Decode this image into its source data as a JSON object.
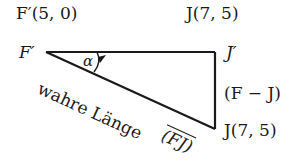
{
  "labels": {
    "f_prime_coord": "F′(5, 0)",
    "j_coord_top": "J(7, 5)",
    "f_prime": "F′",
    "j_prime": "J′",
    "alpha": "α",
    "f_minus_j": "(F − J)",
    "wahre_laenge": "wahre Länge",
    "fj": "(FJ)",
    "j_coord_bottom": "J(7, 5)"
  },
  "geometry": {
    "f_prime_point": [
      46,
      52
    ],
    "j_prime_point": [
      215,
      52
    ],
    "j_point": [
      215,
      128
    ]
  },
  "colors": {
    "line": "#1a1a1a",
    "text": "#1a1a1a",
    "background": "#ffffff"
  }
}
